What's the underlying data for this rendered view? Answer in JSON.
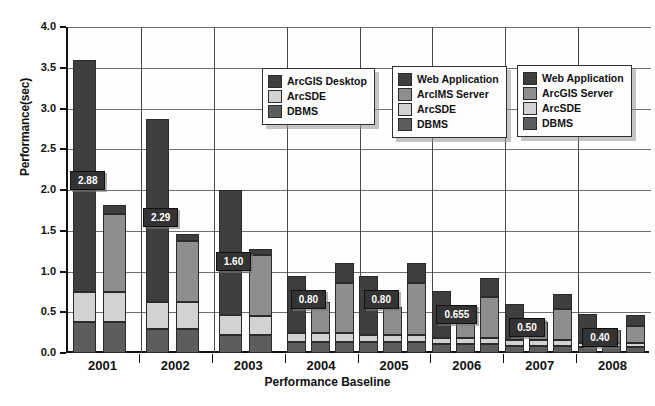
{
  "chart_data": {
    "type": "bar",
    "title": "",
    "xlabel": "Performance Baseline",
    "ylabel": "Performance(sec)",
    "ylim": [
      0.0,
      4.0
    ],
    "ytick_labels": [
      "0.0",
      "0.5",
      "1.0",
      "1.5",
      "2.0",
      "2.5",
      "3.0",
      "3.5",
      "4.0"
    ],
    "ytick_values": [
      0.0,
      0.5,
      1.0,
      1.5,
      2.0,
      2.5,
      3.0,
      3.5,
      4.0
    ],
    "grid": true,
    "categories": [
      "2001",
      "2002",
      "2003",
      "2004",
      "2005",
      "2006",
      "2007",
      "2008"
    ],
    "stack_order": [
      "DBMS",
      "ArcSDE",
      "Middle",
      "Top"
    ],
    "groups": [
      {
        "category": "2001",
        "label": "2.88",
        "bars": [
          {
            "name": "desktop-stack",
            "total": 3.6,
            "segments": [
              {
                "series": "DBMS",
                "value": 0.38
              },
              {
                "series": "ArcSDE",
                "value": 0.37
              },
              {
                "series": "ArcGIS Desktop",
                "value": 2.85
              }
            ]
          },
          {
            "name": "web-stack",
            "total": 1.82,
            "segments": [
              {
                "series": "DBMS",
                "value": 0.38
              },
              {
                "series": "ArcSDE",
                "value": 0.37
              },
              {
                "series": "ArcIMS Server",
                "value": 0.95
              },
              {
                "series": "Web Application",
                "value": 0.12
              }
            ]
          }
        ]
      },
      {
        "category": "2002",
        "label": "2.29",
        "bars": [
          {
            "name": "desktop-stack",
            "total": 2.87,
            "segments": [
              {
                "series": "DBMS",
                "value": 0.3
              },
              {
                "series": "ArcSDE",
                "value": 0.33
              },
              {
                "series": "ArcGIS Desktop",
                "value": 2.24
              }
            ]
          },
          {
            "name": "web-stack",
            "total": 1.46,
            "segments": [
              {
                "series": "DBMS",
                "value": 0.3
              },
              {
                "series": "ArcSDE",
                "value": 0.32
              },
              {
                "series": "ArcIMS Server",
                "value": 0.76
              },
              {
                "series": "Web Application",
                "value": 0.08
              }
            ]
          }
        ]
      },
      {
        "category": "2003",
        "label": "1.60",
        "bars": [
          {
            "name": "desktop-stack",
            "total": 2.0,
            "segments": [
              {
                "series": "DBMS",
                "value": 0.22
              },
              {
                "series": "ArcSDE",
                "value": 0.25
              },
              {
                "series": "ArcGIS Desktop",
                "value": 1.53
              }
            ]
          },
          {
            "name": "web-stack",
            "total": 1.28,
            "segments": [
              {
                "series": "DBMS",
                "value": 0.22
              },
              {
                "series": "ArcSDE",
                "value": 0.24
              },
              {
                "series": "ArcIMS Server",
                "value": 0.74
              },
              {
                "series": "Web Application",
                "value": 0.08
              }
            ]
          }
        ]
      },
      {
        "category": "2004",
        "label": "0.80",
        "bars": [
          {
            "name": "desktop-stack",
            "total": 0.95,
            "segments": [
              {
                "series": "DBMS",
                "value": 0.14
              },
              {
                "series": "ArcSDE",
                "value": 0.1
              },
              {
                "series": "ArcGIS Desktop",
                "value": 0.71
              }
            ]
          },
          {
            "name": "web-stack",
            "total": 0.62,
            "segments": [
              {
                "series": "DBMS",
                "value": 0.14
              },
              {
                "series": "ArcSDE",
                "value": 0.1
              },
              {
                "series": "ArcIMS Server",
                "value": 0.38
              }
            ]
          },
          {
            "name": "server-stack",
            "total": 1.1,
            "segments": [
              {
                "series": "DBMS",
                "value": 0.14
              },
              {
                "series": "ArcSDE",
                "value": 0.1
              },
              {
                "series": "ArcGIS Server",
                "value": 0.62
              },
              {
                "series": "Web Application",
                "value": 0.24
              }
            ]
          }
        ]
      },
      {
        "category": "2005",
        "label": "0.80",
        "bars": [
          {
            "name": "desktop-stack",
            "total": 0.95,
            "segments": [
              {
                "series": "DBMS",
                "value": 0.13
              },
              {
                "series": "ArcSDE",
                "value": 0.09
              },
              {
                "series": "ArcGIS Desktop",
                "value": 0.73
              }
            ]
          },
          {
            "name": "web-stack",
            "total": 0.57,
            "segments": [
              {
                "series": "DBMS",
                "value": 0.13
              },
              {
                "series": "ArcSDE",
                "value": 0.09
              },
              {
                "series": "ArcIMS Server",
                "value": 0.35
              }
            ]
          },
          {
            "name": "server-stack",
            "total": 1.1,
            "segments": [
              {
                "series": "DBMS",
                "value": 0.13
              },
              {
                "series": "ArcSDE",
                "value": 0.09
              },
              {
                "series": "ArcGIS Server",
                "value": 0.64
              },
              {
                "series": "Web Application",
                "value": 0.24
              }
            ]
          }
        ]
      },
      {
        "category": "2006",
        "label": "0.655",
        "bars": [
          {
            "name": "desktop-stack",
            "total": 0.76,
            "segments": [
              {
                "series": "DBMS",
                "value": 0.11
              },
              {
                "series": "ArcSDE",
                "value": 0.08
              },
              {
                "series": "ArcGIS Desktop",
                "value": 0.57
              }
            ]
          },
          {
            "name": "web-stack",
            "total": 0.47,
            "segments": [
              {
                "series": "DBMS",
                "value": 0.11
              },
              {
                "series": "ArcSDE",
                "value": 0.08
              },
              {
                "series": "ArcIMS Server",
                "value": 0.28
              }
            ]
          },
          {
            "name": "server-stack",
            "total": 0.92,
            "segments": [
              {
                "series": "DBMS",
                "value": 0.11
              },
              {
                "series": "ArcSDE",
                "value": 0.08
              },
              {
                "series": "ArcGIS Server",
                "value": 0.5
              },
              {
                "series": "Web Application",
                "value": 0.23
              }
            ]
          }
        ]
      },
      {
        "category": "2007",
        "label": "0.50",
        "bars": [
          {
            "name": "desktop-stack",
            "total": 0.6,
            "segments": [
              {
                "series": "DBMS",
                "value": 0.09
              },
              {
                "series": "ArcSDE",
                "value": 0.07
              },
              {
                "series": "ArcGIS Desktop",
                "value": 0.44
              }
            ]
          },
          {
            "name": "web-stack",
            "total": 0.38,
            "segments": [
              {
                "series": "DBMS",
                "value": 0.09
              },
              {
                "series": "ArcSDE",
                "value": 0.07
              },
              {
                "series": "ArcIMS Server",
                "value": 0.22
              }
            ]
          },
          {
            "name": "server-stack",
            "total": 0.72,
            "segments": [
              {
                "series": "DBMS",
                "value": 0.09
              },
              {
                "series": "ArcSDE",
                "value": 0.07
              },
              {
                "series": "ArcGIS Server",
                "value": 0.38
              },
              {
                "series": "Web Application",
                "value": 0.18
              }
            ]
          }
        ]
      },
      {
        "category": "2008",
        "label": "0.40",
        "bars": [
          {
            "name": "desktop-stack",
            "total": 0.48,
            "segments": [
              {
                "series": "DBMS",
                "value": 0.07
              },
              {
                "series": "ArcSDE",
                "value": 0.05
              },
              {
                "series": "ArcGIS Desktop",
                "value": 0.36
              }
            ]
          },
          {
            "name": "web-stack",
            "total": 0.28,
            "segments": [
              {
                "series": "DBMS",
                "value": 0.07
              },
              {
                "series": "ArcSDE",
                "value": 0.05
              },
              {
                "series": "ArcIMS Server",
                "value": 0.16
              }
            ]
          },
          {
            "name": "server-stack",
            "total": 0.47,
            "segments": [
              {
                "series": "DBMS",
                "value": 0.07
              },
              {
                "series": "ArcSDE",
                "value": 0.05
              },
              {
                "series": "ArcGIS Server",
                "value": 0.21
              },
              {
                "series": "Web Application",
                "value": 0.14
              }
            ]
          }
        ]
      }
    ],
    "colors": {
      "ArcGIS Desktop": "#3e3e3e",
      "Web Application": "#3e3e3e",
      "ArcIMS Server": "#8e8e8e",
      "ArcGIS Server": "#8e8e8e",
      "ArcSDE": "#d2d2d2",
      "DBMS": "#5d5d5d",
      "grid": "#6f6f6f",
      "axis": "#111111",
      "label_bg": "#333333",
      "label_fg": "#ffffff"
    }
  },
  "legends": [
    {
      "name": "legend-desktop",
      "position": {
        "left": 262,
        "top": 68
      },
      "items": [
        {
          "label": "ArcGIS Desktop",
          "color": "#3e3e3e"
        },
        {
          "label": "ArcSDE",
          "color": "#d2d2d2"
        },
        {
          "label": "DBMS",
          "color": "#5d5d5d"
        }
      ]
    },
    {
      "name": "legend-arcims",
      "position": {
        "left": 392,
        "top": 66
      },
      "items": [
        {
          "label": "Web Application",
          "color": "#3e3e3e"
        },
        {
          "label": "ArcIMS Server",
          "color": "#8e8e8e"
        },
        {
          "label": "ArcSDE",
          "color": "#d2d2d2"
        },
        {
          "label": "DBMS",
          "color": "#5d5d5d"
        }
      ]
    },
    {
      "name": "legend-arcgis-server",
      "position": {
        "left": 517,
        "top": 65
      },
      "items": [
        {
          "label": "Web Application",
          "color": "#3e3e3e"
        },
        {
          "label": "ArcGIS Server",
          "color": "#8e8e8e"
        },
        {
          "label": "ArcSDE",
          "color": "#d2d2d2"
        },
        {
          "label": "DBMS",
          "color": "#5d5d5d"
        }
      ]
    }
  ]
}
